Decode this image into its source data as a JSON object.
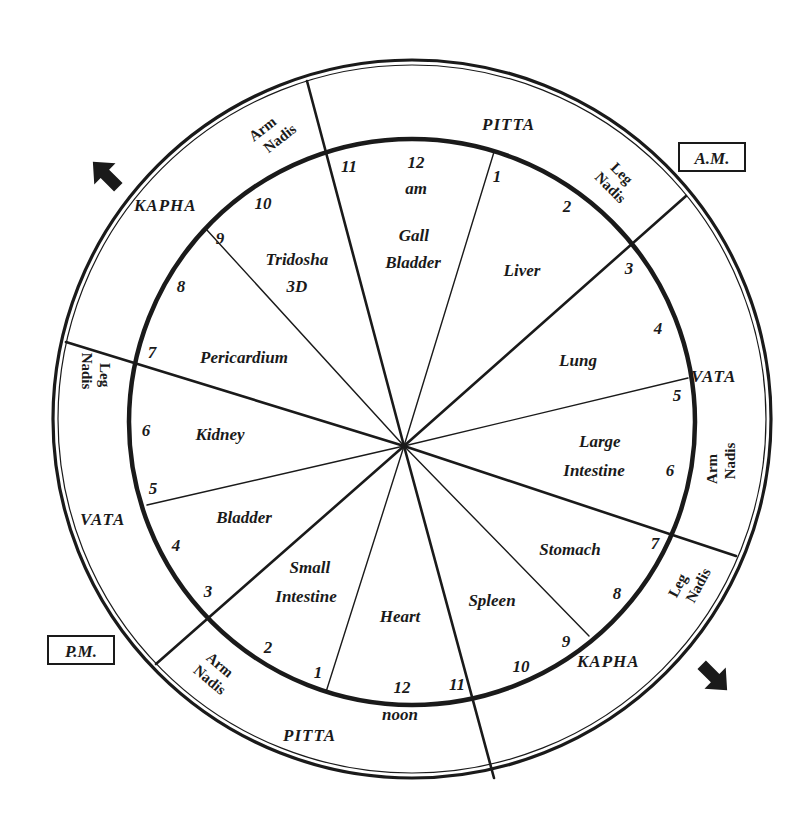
{
  "colors": {
    "ink": "#1a1a1a",
    "background": "#ffffff"
  },
  "labels": {
    "am": "A.M.",
    "pm": "P.M."
  },
  "organs": [
    {
      "id": "gall-bladder",
      "lines": [
        "Gall",
        "Bladder"
      ]
    },
    {
      "id": "liver",
      "lines": [
        "Liver"
      ]
    },
    {
      "id": "lung",
      "lines": [
        "Lung"
      ]
    },
    {
      "id": "large-intestine",
      "lines": [
        "Large",
        "Intestine"
      ]
    },
    {
      "id": "stomach",
      "lines": [
        "Stomach"
      ]
    },
    {
      "id": "spleen",
      "lines": [
        "Spleen"
      ]
    },
    {
      "id": "heart",
      "lines": [
        "Heart"
      ]
    },
    {
      "id": "small-intestine",
      "lines": [
        "Small",
        "Intestine"
      ]
    },
    {
      "id": "bladder",
      "lines": [
        "Bladder"
      ]
    },
    {
      "id": "kidney",
      "lines": [
        "Kidney"
      ]
    },
    {
      "id": "pericardium",
      "lines": [
        "Pericardium"
      ]
    },
    {
      "id": "tridosha",
      "lines": [
        "Tridosha",
        "3D"
      ]
    }
  ],
  "hours_am": [
    "12",
    "am",
    "1",
    "2",
    "3",
    "4",
    "5",
    "6",
    "7",
    "8",
    "9",
    "10",
    "11"
  ],
  "hours_pm": [
    "12",
    "noon",
    "1",
    "2",
    "3",
    "4",
    "5",
    "6",
    "7",
    "8",
    "9",
    "10",
    "11"
  ],
  "doshas": {
    "pitta_top": "PITTA",
    "vata_right": "VATA",
    "kapha_bottom_right": "KAPHA",
    "pitta_bottom": "PITTA",
    "vata_left": "VATA",
    "kapha_top_left": "KAPHA"
  },
  "nadis": {
    "arm_top_left": [
      "Arm",
      "Nadis"
    ],
    "leg_top_right": [
      "Leg",
      "Nadis"
    ],
    "arm_right": [
      "Arm",
      "Nadis"
    ],
    "leg_bottom_right": [
      "Leg",
      "Nadis"
    ],
    "arm_bottom_left": [
      "Arm",
      "Nadis"
    ],
    "leg_left": [
      "Leg",
      "Nadis"
    ]
  },
  "icons": {
    "arrow_top_left": "clockwise-arrow-icon",
    "arrow_bottom_right": "clockwise-arrow-icon"
  }
}
